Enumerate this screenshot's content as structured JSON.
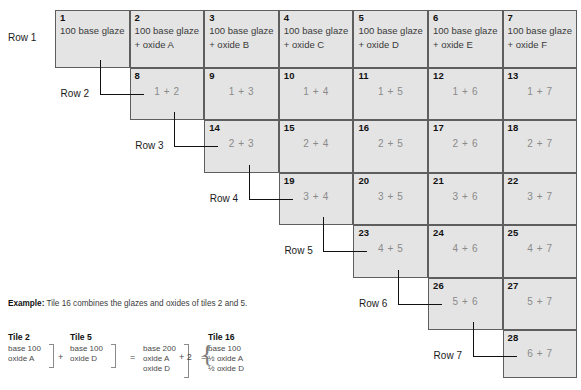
{
  "diagram": {
    "title_hidden": "Glaze and oxide combination tile grid",
    "row_labels": [
      {
        "id": "row-1",
        "text": "Row 1"
      },
      {
        "id": "row-2",
        "text": "Row 2"
      },
      {
        "id": "row-3",
        "text": "Row 3"
      },
      {
        "id": "row-4",
        "text": "Row 4"
      },
      {
        "id": "row-5",
        "text": "Row 5"
      },
      {
        "id": "row-6",
        "text": "Row 6"
      },
      {
        "id": "row-7",
        "text": "Row 7"
      }
    ],
    "rows": [
      {
        "row": 1,
        "cells": [
          {
            "num": "1",
            "line1": "100 base glaze",
            "line2": ""
          },
          {
            "num": "2",
            "line1": "100 base glaze",
            "line2": "+ oxide A"
          },
          {
            "num": "3",
            "line1": "100 base glaze",
            "line2": "+ oxide B"
          },
          {
            "num": "4",
            "line1": "100 base glaze",
            "line2": "+ oxide C"
          },
          {
            "num": "5",
            "line1": "100 base glaze",
            "line2": "+ oxide D"
          },
          {
            "num": "6",
            "line1": "100 base glaze",
            "line2": "+ oxide E"
          },
          {
            "num": "7",
            "line1": "100 base glaze",
            "line2": "+ oxide F"
          }
        ]
      },
      {
        "row": 2,
        "cells": [
          {
            "num": "8",
            "combo": "1 + 2"
          },
          {
            "num": "9",
            "combo": "1 + 3"
          },
          {
            "num": "10",
            "combo": "1 + 4"
          },
          {
            "num": "11",
            "combo": "1 + 5"
          },
          {
            "num": "12",
            "combo": "1 + 6"
          },
          {
            "num": "13",
            "combo": "1 + 7"
          }
        ]
      },
      {
        "row": 3,
        "cells": [
          {
            "num": "14",
            "combo": "2 + 3"
          },
          {
            "num": "15",
            "combo": "2 + 4"
          },
          {
            "num": "16",
            "combo": "2 + 5"
          },
          {
            "num": "17",
            "combo": "2 + 6"
          },
          {
            "num": "18",
            "combo": "2 + 7"
          }
        ]
      },
      {
        "row": 4,
        "cells": [
          {
            "num": "19",
            "combo": "3 + 4"
          },
          {
            "num": "20",
            "combo": "3 + 5"
          },
          {
            "num": "21",
            "combo": "3 + 6"
          },
          {
            "num": "22",
            "combo": "3 + 7"
          }
        ]
      },
      {
        "row": 5,
        "cells": [
          {
            "num": "23",
            "combo": "4 + 5"
          },
          {
            "num": "24",
            "combo": "4 + 6"
          },
          {
            "num": "25",
            "combo": "4 + 7"
          }
        ]
      },
      {
        "row": 6,
        "cells": [
          {
            "num": "26",
            "combo": "5 + 6"
          },
          {
            "num": "27",
            "combo": "5 + 7"
          }
        ]
      },
      {
        "row": 7,
        "cells": [
          {
            "num": "28",
            "combo": "6 + 7"
          }
        ]
      }
    ]
  },
  "example": {
    "label": "Example:",
    "text": " Tile 16 combines the glazes and oxides of tiles 2 and 5.",
    "groups": [
      {
        "title": "Tile 2",
        "lines": [
          "base 100",
          "oxide A"
        ]
      },
      {
        "title": "Tile 5",
        "lines": [
          "base 100",
          "oxide D"
        ]
      },
      {
        "title": "",
        "lines": [
          "base 200",
          "oxide A",
          "oxide D"
        ]
      },
      {
        "title": "Tile 16",
        "lines": [
          "base 100",
          "½ oxide A",
          "½ oxide D"
        ]
      }
    ],
    "operators": {
      "plus1": "+",
      "equals1": "=",
      "plus2": "+ 2",
      "equals2": "="
    }
  },
  "colors": {
    "cell_fill": "#e4e4e4",
    "cell_border": "#5e5e5e",
    "combo_text": "#8a8a8a",
    "label_text": "#1b1b1b",
    "page_bg": "#ffffff"
  }
}
